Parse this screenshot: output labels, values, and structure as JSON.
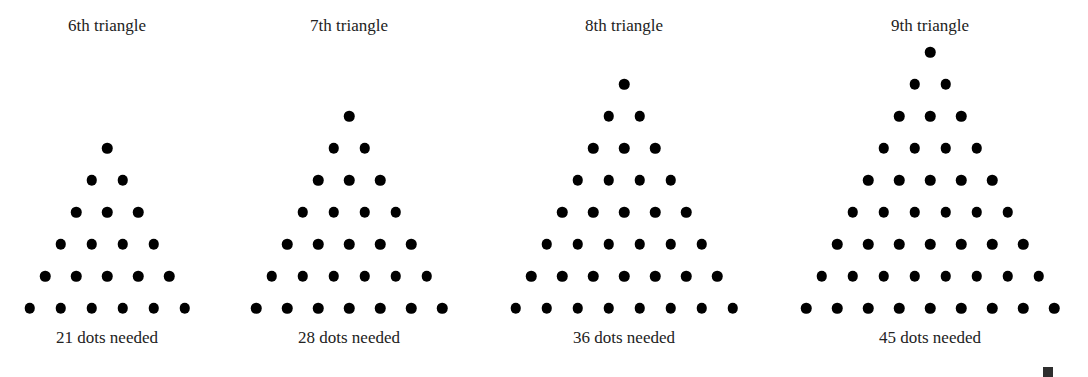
{
  "figure": {
    "dot_color": "#000000",
    "text_color": "#222222",
    "background": "#ffffff",
    "row_spacing_px": 32,
    "col_spacing_px": 31,
    "base_row_y_px": 308,
    "triangles": [
      {
        "title": "6th triangle",
        "caption": "21 dots needed",
        "n": 6,
        "dots": 21,
        "center_x": 107
      },
      {
        "title": "7th triangle",
        "caption": "28 dots needed",
        "n": 7,
        "dots": 28,
        "center_x": 349
      },
      {
        "title": "8th triangle",
        "caption": "36 dots needed",
        "n": 8,
        "dots": 36,
        "center_x": 624
      },
      {
        "title": "9th triangle",
        "caption": "45 dots needed",
        "n": 9,
        "dots": 45,
        "center_x": 930
      }
    ],
    "end_marker": "qed-square"
  }
}
